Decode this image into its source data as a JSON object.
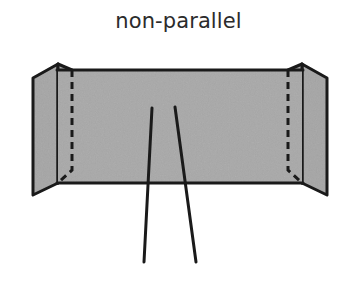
{
  "figure": {
    "title": "non-parallel",
    "background_color": "#ffffff",
    "stroke_color": "#1a1a1a",
    "panel_fill_color": "#a8a8a8",
    "flap_fill_color": "#a5a5a5",
    "title_color": "#2b2b2b"
  },
  "diagram": {
    "type": "line-drawing",
    "main_panel": {
      "name": "center-panel",
      "top_edge_y": 70,
      "bottom_edge_y": 183,
      "left_crease_x": 72,
      "right_crease_x": 288
    },
    "left_flap": {
      "name": "left-flap",
      "crease_x": 58,
      "outer_edge_x": 33,
      "dashed_fold_x": 72,
      "top_peak_y": 62,
      "outer_top_y": 78,
      "outer_bottom_y": 195
    },
    "right_flap": {
      "name": "right-flap",
      "crease_x": 302,
      "outer_edge_x": 327,
      "dashed_fold_x": 288,
      "top_peak_y": 62,
      "outer_top_y": 78,
      "outer_bottom_y": 195
    },
    "lines": [
      {
        "name": "line-left",
        "label": "left line",
        "x1": 152,
        "y1": 108,
        "x2": 144,
        "y2": 262,
        "parallel": false
      },
      {
        "name": "line-right",
        "label": "right line",
        "x1": 175,
        "y1": 107,
        "x2": 196,
        "y2": 262,
        "parallel": false
      }
    ],
    "dashed_style": {
      "dash_length": 7,
      "gap_length": 5,
      "stroke_width": 3
    }
  }
}
